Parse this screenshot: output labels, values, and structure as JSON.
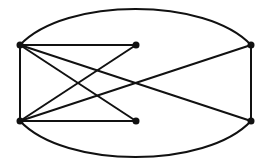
{
  "graph": {
    "nodes": [
      {
        "id": "A",
        "x": 20,
        "y": 45
      },
      {
        "id": "B",
        "x": 136,
        "y": 45
      },
      {
        "id": "C",
        "x": 251,
        "y": 45
      },
      {
        "id": "D",
        "x": 20,
        "y": 121
      },
      {
        "id": "E",
        "x": 136,
        "y": 121
      },
      {
        "id": "F",
        "x": 251,
        "y": 121
      }
    ],
    "edges": [
      {
        "from": "A",
        "to": "B",
        "type": "line"
      },
      {
        "from": "A",
        "to": "D",
        "type": "line"
      },
      {
        "from": "A",
        "to": "E",
        "type": "line"
      },
      {
        "from": "A",
        "to": "F",
        "type": "line"
      },
      {
        "from": "D",
        "to": "B",
        "type": "line"
      },
      {
        "from": "D",
        "to": "E",
        "type": "line"
      },
      {
        "from": "D",
        "to": "C",
        "type": "line"
      },
      {
        "from": "C",
        "to": "F",
        "type": "line"
      },
      {
        "from": "A",
        "to": "C",
        "type": "curve-top"
      },
      {
        "from": "D",
        "to": "F",
        "type": "curve-bottom"
      }
    ],
    "stroke_color": "#111111",
    "node_color": "#111111"
  }
}
